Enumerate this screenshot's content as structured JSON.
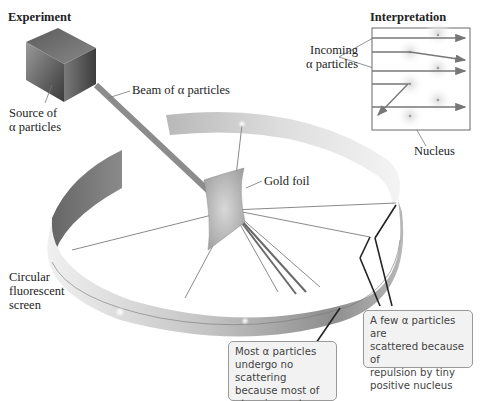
{
  "diagram": {
    "type": "rutherford-gold-foil-experiment",
    "sections": {
      "experiment_title": "Experiment",
      "interpretation_title": "Interpretation"
    },
    "labels": {
      "source_line1": "Source of",
      "source_line2": "α particles",
      "beam": "Beam of α particles",
      "gold_foil": "Gold foil",
      "screen_line1": "Circular",
      "screen_line2": "fluorescent",
      "screen_line3": "screen",
      "incoming_line1": "Incoming",
      "incoming_line2": "α particles",
      "nucleus": "Nucleus"
    },
    "callouts": {
      "most": {
        "line1": "Most α particles",
        "line2": "undergo no scattering",
        "line3": "because most of",
        "line4": "atom is empty"
      },
      "few": {
        "line1": "A few α particles are",
        "line2": "scattered because of",
        "line3": "repulsion by tiny",
        "line4": "positive nucleus"
      }
    },
    "colors": {
      "ring_light": "#e6e6e6",
      "ring_dark": "#8a8a8a",
      "source_box": "#6e6e6e",
      "beam": "#8c8c8c",
      "callout_bg": "#f2f2f2",
      "callout_border": "#999999"
    }
  }
}
